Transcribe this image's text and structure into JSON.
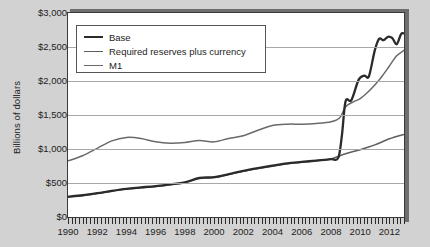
{
  "chart_data": {
    "type": "line",
    "title": "",
    "xlabel": "",
    "ylabel": "Billions of dollars",
    "xlim": [
      1990,
      2013
    ],
    "ylim": [
      0,
      3000
    ],
    "grid": true,
    "legend_position": "top-left",
    "y_ticks": [
      "$0",
      "$500",
      "$1,000",
      "$1,500",
      "$2,000",
      "$2,500",
      "$3,000"
    ],
    "y_tick_values": [
      0,
      500,
      1000,
      1500,
      2000,
      2500,
      3000
    ],
    "x_ticks": [
      "1990",
      "1992",
      "1994",
      "1996",
      "1998",
      "2000",
      "2002",
      "2004",
      "2006",
      "2008",
      "2010",
      "2012"
    ],
    "x_tick_values": [
      1990,
      1992,
      1994,
      1996,
      1998,
      2000,
      2002,
      2004,
      2006,
      2008,
      2010,
      2012
    ],
    "colors": {
      "base": "#2b2b2b",
      "required_reserves_plus_currency": "#5e5e5e",
      "m1": "#6a6a6a",
      "plot_background": "#ffffff",
      "page_background": "#d2d2d2",
      "gridline": "#a8a8a8",
      "axis": "#3a3a3a"
    },
    "series": [
      {
        "name": "Base",
        "x": [
          1990,
          1991,
          1992,
          1993,
          1994,
          1995,
          1996,
          1997,
          1998,
          1999,
          2000,
          2001,
          2002,
          2003,
          2004,
          2005,
          2006,
          2007,
          2008.0,
          2008.5,
          2008.75,
          2009.0,
          2009.4,
          2009.9,
          2010.3,
          2010.6,
          2011.0,
          2011.3,
          2011.6,
          2011.9,
          2012.2,
          2012.5,
          2012.8,
          2013.0
        ],
        "values": [
          300,
          320,
          350,
          385,
          415,
          435,
          455,
          480,
          510,
          575,
          585,
          630,
          680,
          720,
          755,
          790,
          810,
          830,
          850,
          870,
          1200,
          1700,
          1720,
          2020,
          2080,
          2070,
          2450,
          2620,
          2600,
          2650,
          2630,
          2540,
          2690,
          2700
        ]
      },
      {
        "name": "Required reserves plus currency",
        "x": [
          1990,
          1991,
          1992,
          1993,
          1994,
          1995,
          1996,
          1997,
          1998,
          1999,
          2000,
          2001,
          2002,
          2003,
          2004,
          2005,
          2006,
          2007,
          2008,
          2009,
          2010,
          2011,
          2012,
          2013
        ],
        "values": [
          295,
          315,
          345,
          380,
          410,
          430,
          450,
          475,
          505,
          565,
          580,
          625,
          672,
          712,
          748,
          782,
          805,
          828,
          855,
          930,
          990,
          1060,
          1150,
          1215
        ]
      },
      {
        "name": "M1",
        "x": [
          1990,
          1991,
          1992,
          1993,
          1994,
          1995,
          1996,
          1997,
          1998,
          1999,
          2000,
          2001,
          2002,
          2003,
          2004,
          2005,
          2006,
          2007,
          2008.0,
          2008.6,
          2009.0,
          2009.5,
          2010.0,
          2010.5,
          2011.0,
          2011.5,
          2012.0,
          2012.5,
          2013.0
        ],
        "values": [
          825,
          900,
          1010,
          1120,
          1170,
          1155,
          1105,
          1085,
          1095,
          1125,
          1105,
          1155,
          1195,
          1275,
          1345,
          1365,
          1365,
          1375,
          1400,
          1460,
          1620,
          1690,
          1740,
          1830,
          1940,
          2070,
          2220,
          2370,
          2450
        ]
      }
    ]
  },
  "legend": {
    "items": [
      {
        "label": "Base",
        "color": "#2b2b2b",
        "width": 2.6
      },
      {
        "label": "Required reserves plus currency",
        "color": "#5e5e5e",
        "width": 1.7
      },
      {
        "label": "M1",
        "color": "#6a6a6a",
        "width": 1.7
      }
    ]
  }
}
